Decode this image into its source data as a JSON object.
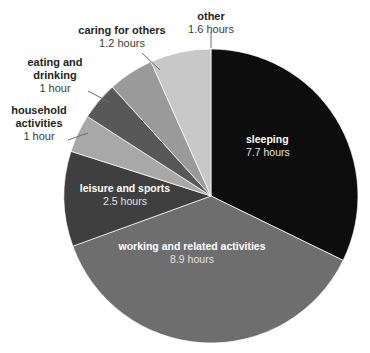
{
  "chart_data": {
    "type": "pie",
    "title": "",
    "subtitle": "",
    "xlabel": "",
    "ylabel": "",
    "unit": "hours",
    "legend_position": "none",
    "grid": false,
    "total_hours": 23.9,
    "categories": [
      "sleeping",
      "working and related activities",
      "leisure and sports",
      "household activities",
      "eating and drinking",
      "caring for others",
      "other"
    ],
    "values": [
      7.7,
      8.9,
      2.5,
      1.0,
      1.0,
      1.2,
      1.6
    ],
    "slices": [
      {
        "label": "sleeping",
        "value_text": "7.7 hours",
        "value": 7.7,
        "color": "#0d0d0d",
        "label_placement": "inside"
      },
      {
        "label": "working and related activities",
        "value_text": "8.9 hours",
        "value": 8.9,
        "color": "#6e6e6e",
        "label_placement": "inside"
      },
      {
        "label": "leisure and sports",
        "value_text": "2.5 hours",
        "value": 2.5,
        "color": "#3f3f3f",
        "label_placement": "inside"
      },
      {
        "label": "household activities",
        "value_text": "1 hour",
        "value": 1.0,
        "color": "#a8a8a8",
        "label_placement": "outside"
      },
      {
        "label": "eating and drinking",
        "value_text": "1 hour",
        "value": 1.0,
        "color": "#585858",
        "label_placement": "outside"
      },
      {
        "label": "caring for others",
        "value_text": "1.2 hours",
        "value": 1.2,
        "color": "#9a9a9a",
        "label_placement": "outside"
      },
      {
        "label": "other",
        "value_text": "1.6 hours",
        "value": 1.6,
        "color": "#c8c8c8",
        "label_placement": "outside"
      }
    ]
  },
  "labels": {
    "sleeping": {
      "name": "sleeping",
      "hours": "7.7 hours"
    },
    "working": {
      "name": "working and related activities",
      "hours": "8.9 hours"
    },
    "leisure": {
      "name": "leisure and sports",
      "hours": "2.5 hours"
    },
    "household": {
      "name": "household activities",
      "hours": "1 hour"
    },
    "eating": {
      "name": "eating and drinking",
      "hours": "1 hour"
    },
    "caring": {
      "name": "caring for others",
      "hours": "1.2 hours"
    },
    "other": {
      "name": "other",
      "hours": "1.6 hours"
    }
  },
  "label_lines": {
    "household_line": "leader-line",
    "eating_line": "leader-line",
    "caring_line": "leader-line",
    "other_line": "leader-line"
  }
}
